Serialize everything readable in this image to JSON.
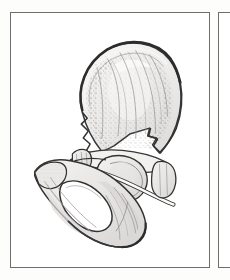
{
  "page": {
    "background_color": "#fdfdfc",
    "width": 230,
    "height": 280,
    "media": "scanned anatomical atlas page"
  },
  "panels": [
    {
      "id": "main-figure-panel",
      "role": "primary illustration frame",
      "border_color": "#6d6d6d",
      "fill_color": "#ffffff",
      "x": 10,
      "y": 12,
      "width": 200,
      "height": 256
    },
    {
      "id": "adjacent-figure-panel",
      "role": "edge of neighbouring illustration frame, cropped by page edge",
      "border_color": "#6d6d6d",
      "fill_color": "#ffffff",
      "x": 218,
      "y": 12,
      "width": 24,
      "height": 256
    }
  ],
  "illustration": {
    "name": "hip-bone-os-coxae",
    "subject": "Hip bone (os coxae) in lateral view",
    "technique": "pen-and-ink line drawing with stipple and hatch shading",
    "outline_color": "#2b2b2b",
    "fill_color": "#eceae8",
    "stipple_color": "#7a7a7a",
    "shadow_color": "#c9c7c5",
    "highlight_color": "#fafafa",
    "regions": [
      {
        "name": "ilium",
        "label": "iliac blade"
      },
      {
        "name": "iliac-crest",
        "label": "iliac crest"
      },
      {
        "name": "anterior-superior-iliac-spine",
        "label": "anterior superior iliac spine"
      },
      {
        "name": "anterior-inferior-iliac-spine",
        "label": "anterior inferior iliac spine"
      },
      {
        "name": "greater-sciatic-notch",
        "label": "greater sciatic notch"
      },
      {
        "name": "acetabulum",
        "label": "acetabulum"
      },
      {
        "name": "obturator-foramen",
        "label": "obturator foramen"
      },
      {
        "name": "pubis",
        "label": "pubic body and ramus"
      },
      {
        "name": "ischium",
        "label": "ischial body and ramus"
      },
      {
        "name": "ischial-tuberosity",
        "label": "ischial tuberosity"
      }
    ]
  },
  "labels": {
    "visible_text": "",
    "note": "no printed text, captions, numbers or leader labels are visible within the cropped region"
  }
}
